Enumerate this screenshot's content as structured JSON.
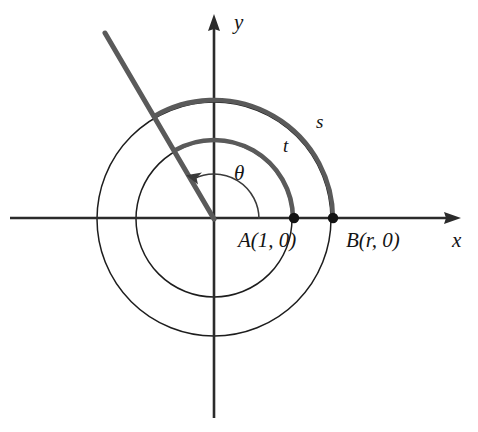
{
  "figure": {
    "background_color": "#ffffff",
    "axis_color": "#2b2b2b",
    "circle_color": "#1d1d1d",
    "arc_color": "#5a5a5a",
    "point_color": "#121212"
  },
  "axes": {
    "x_label": "x",
    "y_label": "y",
    "origin": {
      "x": 214,
      "y": 219
    },
    "x_arrow_tip": {
      "x": 461,
      "y": 218
    },
    "y_arrow_tip": {
      "x": 214,
      "y": 14
    },
    "x_start": {
      "x": 10,
      "y": 218
    },
    "y_end": {
      "x": 214,
      "y": 418
    }
  },
  "circles": [
    {
      "name": "inner-circle",
      "radius": 78
    },
    {
      "name": "outer-circle",
      "radius": 117
    }
  ],
  "arcs": [
    {
      "name": "arc-t",
      "label": "t",
      "radius": 79,
      "start_angle_deg": 0,
      "end_angle_deg": 120,
      "label_pos": {
        "x": 283,
        "y": 152
      }
    },
    {
      "name": "arc-s",
      "label": "s",
      "radius": 119,
      "start_angle_deg": 0,
      "end_angle_deg": 120,
      "label_pos": {
        "x": 316,
        "y": 128
      }
    }
  ],
  "angle": {
    "symbol": "θ",
    "label_pos": {
      "x": 234,
      "y": 180
    },
    "arc_radius": 45,
    "arrow_at_deg": 120
  },
  "ray": {
    "name": "terminal-ray",
    "angle_deg": 120,
    "from": {
      "x": 214,
      "y": 219
    },
    "to": {
      "x": 105,
      "y": 33
    }
  },
  "points": [
    {
      "name": "point-a",
      "label": "A(1, 0)",
      "label_parts": {
        "letter": "A",
        "open": "(",
        "value": "1",
        "comma": ", ",
        "second": "0",
        "close": ")"
      },
      "x": 294,
      "y": 218,
      "label_pos": {
        "x": 238,
        "y": 247
      }
    },
    {
      "name": "point-b",
      "label": "B(r, 0)",
      "label_parts": {
        "letter": "B",
        "open": "(",
        "value": "r",
        "comma": ", ",
        "second": "0",
        "close": ")"
      },
      "x": 333,
      "y": 218,
      "label_pos": {
        "x": 346,
        "y": 247
      }
    }
  ],
  "labels": {
    "x_axis": {
      "text": "x",
      "x": 452,
      "y": 247
    },
    "y_axis": {
      "text": "y",
      "x": 234,
      "y": 29
    }
  }
}
